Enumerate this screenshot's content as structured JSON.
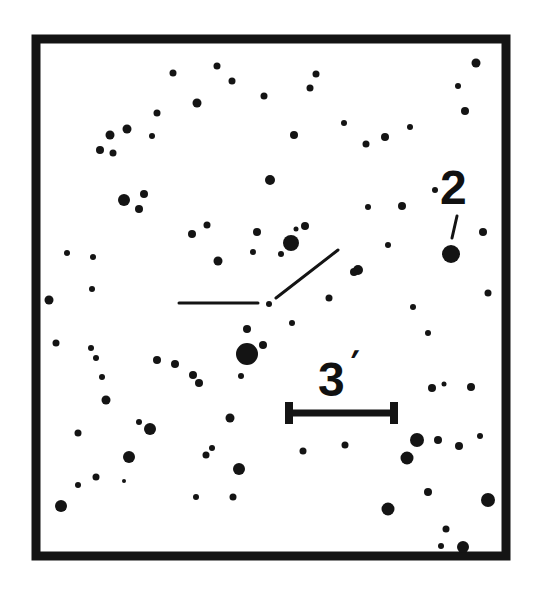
{
  "finder_chart": {
    "frame": {
      "x": 36,
      "y": 39,
      "width": 470,
      "height": 517,
      "stroke": 9,
      "color": "#141414"
    },
    "scale_bar": {
      "label": "3",
      "prime": "′",
      "x1": 289,
      "x2": 394,
      "y": 413,
      "cap_height": 22
    },
    "target_marker": {
      "horizontal_tick": {
        "x1": 179,
        "y1": 303,
        "x2": 258,
        "y2": 303
      },
      "diagonal_tick": {
        "x1": 276,
        "y1": 298,
        "x2": 338,
        "y2": 250
      },
      "target_star": {
        "x": 269,
        "y": 304,
        "r": 3
      }
    },
    "comparison_star": {
      "label": "2",
      "x": 451,
      "y": 254,
      "r": 9,
      "pointer": {
        "x1": 457,
        "y1": 216,
        "x2": 452,
        "y2": 238
      }
    },
    "stars": [
      [
        173,
        73,
        3.5
      ],
      [
        217,
        66,
        3.5
      ],
      [
        232,
        81,
        3.5
      ],
      [
        264,
        96,
        3.5
      ],
      [
        197,
        103,
        4.5
      ],
      [
        157,
        113,
        3.5
      ],
      [
        127,
        129,
        4.5
      ],
      [
        110,
        135,
        4.5
      ],
      [
        152,
        136,
        3
      ],
      [
        100,
        150,
        4
      ],
      [
        113,
        153,
        3.5
      ],
      [
        316,
        74,
        3.5
      ],
      [
        310,
        88,
        3.5
      ],
      [
        294,
        135,
        4
      ],
      [
        344,
        123,
        3
      ],
      [
        366,
        144,
        3.5
      ],
      [
        385,
        137,
        4
      ],
      [
        410,
        127,
        3
      ],
      [
        476,
        63,
        4.5
      ],
      [
        458,
        86,
        3
      ],
      [
        465,
        111,
        4
      ],
      [
        270,
        180,
        5
      ],
      [
        124,
        200,
        6
      ],
      [
        144,
        194,
        4
      ],
      [
        139,
        209,
        4
      ],
      [
        435,
        190,
        3
      ],
      [
        402,
        206,
        4
      ],
      [
        368,
        207,
        3
      ],
      [
        207,
        225,
        3.5
      ],
      [
        192,
        234,
        4
      ],
      [
        257,
        232,
        4
      ],
      [
        291,
        243,
        8
      ],
      [
        305,
        226,
        4
      ],
      [
        296,
        229,
        2.5
      ],
      [
        281,
        254,
        3
      ],
      [
        253,
        252,
        3
      ],
      [
        218,
        261,
        4.5
      ],
      [
        388,
        245,
        3
      ],
      [
        483,
        232,
        4
      ],
      [
        358,
        270,
        5
      ],
      [
        354,
        272,
        4
      ],
      [
        329,
        298,
        3.5
      ],
      [
        292,
        323,
        3
      ],
      [
        67,
        253,
        3
      ],
      [
        93,
        257,
        3
      ],
      [
        92,
        289,
        3
      ],
      [
        49,
        300,
        4.5
      ],
      [
        247,
        329,
        4
      ],
      [
        263,
        345,
        4
      ],
      [
        247,
        354,
        11
      ],
      [
        241,
        376,
        3
      ],
      [
        413,
        307,
        3
      ],
      [
        428,
        333,
        3
      ],
      [
        488,
        293,
        3.5
      ],
      [
        56,
        343,
        3.5
      ],
      [
        91,
        348,
        3
      ],
      [
        96,
        358,
        3
      ],
      [
        102,
        377,
        3
      ],
      [
        106,
        400,
        4.5
      ],
      [
        157,
        360,
        4
      ],
      [
        175,
        364,
        4
      ],
      [
        193,
        375,
        4
      ],
      [
        199,
        383,
        4
      ],
      [
        230,
        418,
        4.5
      ],
      [
        139,
        422,
        3
      ],
      [
        150,
        429,
        6
      ],
      [
        78,
        433,
        3.5
      ],
      [
        129,
        457,
        6
      ],
      [
        212,
        448,
        3
      ],
      [
        206,
        455,
        3.5
      ],
      [
        239,
        469,
        6
      ],
      [
        96,
        477,
        3.5
      ],
      [
        124,
        481,
        2
      ],
      [
        78,
        485,
        3
      ],
      [
        61,
        506,
        6
      ],
      [
        196,
        497,
        3
      ],
      [
        233,
        497,
        3.5
      ],
      [
        303,
        451,
        3.5
      ],
      [
        345,
        445,
        3.5
      ],
      [
        432,
        388,
        4
      ],
      [
        444,
        384,
        2.5
      ],
      [
        471,
        387,
        4
      ],
      [
        417,
        440,
        7
      ],
      [
        438,
        440,
        4
      ],
      [
        459,
        446,
        4
      ],
      [
        480,
        436,
        3
      ],
      [
        407,
        458,
        6.5
      ],
      [
        428,
        492,
        4
      ],
      [
        488,
        500,
        7
      ],
      [
        388,
        509,
        6.5
      ],
      [
        446,
        529,
        3.5
      ],
      [
        441,
        546,
        3
      ],
      [
        463,
        547,
        6
      ]
    ]
  }
}
